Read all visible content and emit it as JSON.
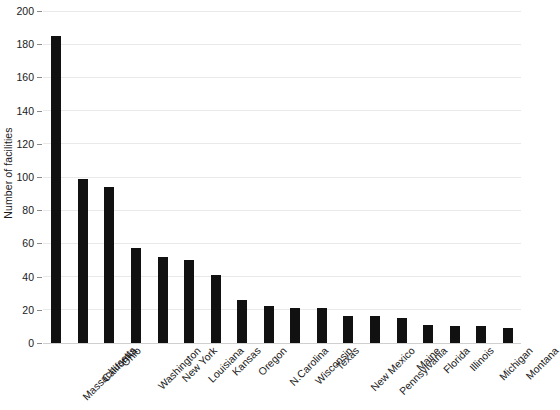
{
  "chart_data": {
    "type": "bar",
    "title": "",
    "xlabel": "",
    "ylabel": "Number of facilities",
    "ylim": [
      0,
      200
    ],
    "ytick_step": 20,
    "yticks": [
      0,
      20,
      40,
      60,
      80,
      100,
      120,
      140,
      160,
      180,
      200
    ],
    "grid": true,
    "legend": "none",
    "bar_color": "#111111",
    "gridline_color": "#e9e9e9",
    "categories": [
      "Massachusetts",
      "California",
      "Ohio",
      "Washington",
      "New York",
      "Louisiana",
      "Kansas",
      "Oregon",
      "N.Carolina",
      "Wisconsin",
      "Texas",
      "New Mexico",
      "Pennsylvania",
      "Maine",
      "Florida",
      "Illinois",
      "Michigan",
      "Montana"
    ],
    "values": [
      185,
      99,
      94,
      57,
      52,
      50,
      41,
      26,
      22,
      21,
      21,
      16,
      16,
      15,
      11,
      10,
      10,
      9
    ]
  }
}
